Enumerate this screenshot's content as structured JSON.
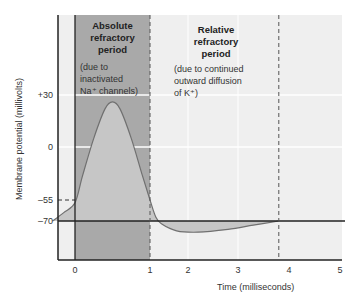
{
  "chart_data": {
    "type": "line",
    "title": "",
    "xlabel": "Time (milliseconds)",
    "ylabel": "Membrane potential (millivolts)",
    "x_ticks": [
      0,
      1,
      2,
      3,
      4,
      5
    ],
    "x_tick_labels": [
      "0",
      "1",
      "2",
      "3",
      "4",
      "5"
    ],
    "y_ticks": [
      30,
      0,
      -55,
      -70
    ],
    "y_tick_labels": [
      "+30",
      "0",
      "–55",
      "–70"
    ],
    "series": [
      {
        "name": "Action potential",
        "points": [
          [
            -0.3,
            -70
          ],
          [
            -0.15,
            -64
          ],
          [
            0,
            -57
          ],
          [
            0.1,
            -30
          ],
          [
            0.25,
            5
          ],
          [
            0.4,
            22
          ],
          [
            0.5,
            26
          ],
          [
            0.6,
            22
          ],
          [
            0.75,
            5
          ],
          [
            0.9,
            -30
          ],
          [
            1.0,
            -55
          ],
          [
            1.15,
            -67
          ],
          [
            1.3,
            -72
          ],
          [
            1.7,
            -77
          ],
          [
            2.2,
            -78
          ],
          [
            2.8,
            -76
          ],
          [
            3.3,
            -73
          ],
          [
            3.8,
            -70
          ]
        ]
      }
    ],
    "threshold_mV": -55,
    "resting_mV": -70,
    "regions": [
      {
        "name": "Absolute refractory period",
        "note_lines": [
          "(due to",
          "inactivated",
          "Na⁺ channels)"
        ],
        "title_lines": [
          "Absolute",
          "refractory",
          "period"
        ],
        "x_start": 0,
        "x_end": 1
      },
      {
        "name": "Relative refractory period",
        "note_lines": [
          "(due to continued",
          "outward diffusion",
          "of K⁺)"
        ],
        "title_lines": [
          "Relative",
          "refractory",
          "period"
        ],
        "x_start": 1,
        "x_end": 3.8
      }
    ],
    "grid": true,
    "colors": {
      "background": "#efefef",
      "absolute_band": "#a9a9a9",
      "curve_fill": "#c6c6c6",
      "curve_line": "#707070",
      "grid": "#ffffff"
    }
  }
}
